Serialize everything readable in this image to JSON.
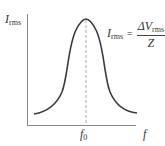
{
  "diagram": {
    "y_axis": {
      "symbol": "I",
      "subscript": "rms"
    },
    "x_axis": {
      "symbol": "f"
    },
    "peak_marker": {
      "symbol": "f",
      "subscript": "0"
    },
    "formula": {
      "lhs_symbol": "I",
      "lhs_subscript": "rms",
      "equals": "=",
      "numerator_symbol": "ΔV",
      "numerator_subscript": "rms",
      "denominator": "Z"
    },
    "colors": {
      "curve": "#3a3a3a",
      "axes": "#888888",
      "dashed_line": "#aaaaaa"
    }
  }
}
